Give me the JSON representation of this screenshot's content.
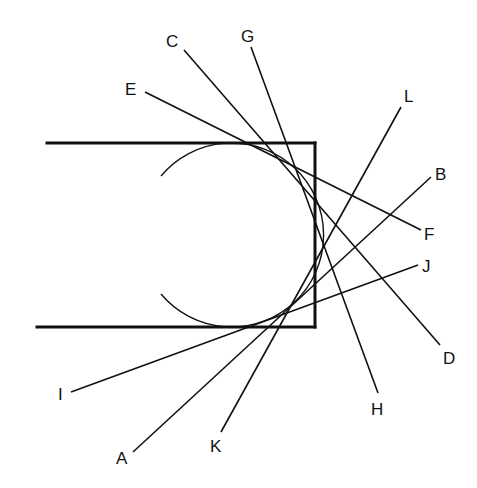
{
  "diagram": {
    "type": "tangent-lines-circle-in-channel",
    "stroke_color": "#111111",
    "background": "#ffffff",
    "channel": {
      "top_edge": {
        "x1": 47,
        "y1": 143,
        "x2": 315,
        "y2": 143
      },
      "right_edge": {
        "x1": 315,
        "y1": 143,
        "x2": 315,
        "y2": 327
      },
      "bottom_edge": {
        "x1": 37,
        "y1": 327,
        "x2": 315,
        "y2": 327
      }
    },
    "circle": {
      "cx": 222,
      "cy": 235,
      "r": 92,
      "arc_path": "M 161 176 A 92 92 0 1 1 161 294"
    },
    "lines": [
      {
        "name": "C-D",
        "from": "C",
        "to": "D",
        "x1": 184,
        "y1": 50,
        "x2": 440,
        "y2": 345
      },
      {
        "name": "G-H",
        "from": "G",
        "to": "H",
        "x1": 251,
        "y1": 47,
        "x2": 378,
        "y2": 393
      },
      {
        "name": "E-F",
        "from": "E",
        "to": "F",
        "x1": 145,
        "y1": 92,
        "x2": 421,
        "y2": 230
      },
      {
        "name": "L-K",
        "from": "L",
        "to": "K",
        "x1": 401,
        "y1": 107,
        "x2": 221,
        "y2": 432
      },
      {
        "name": "B-A",
        "from": "B",
        "to": "A",
        "x1": 431,
        "y1": 177,
        "x2": 133,
        "y2": 452
      },
      {
        "name": "J-I",
        "from": "J",
        "to": "I",
        "x1": 418,
        "y1": 265,
        "x2": 71,
        "y2": 392
      }
    ],
    "labels": [
      {
        "text": "C",
        "x": 166,
        "y": 47
      },
      {
        "text": "G",
        "x": 241,
        "y": 42
      },
      {
        "text": "E",
        "x": 125,
        "y": 95
      },
      {
        "text": "L",
        "x": 404,
        "y": 102
      },
      {
        "text": "B",
        "x": 435,
        "y": 180
      },
      {
        "text": "F",
        "x": 424,
        "y": 240
      },
      {
        "text": "J",
        "x": 422,
        "y": 272
      },
      {
        "text": "D",
        "x": 443,
        "y": 364
      },
      {
        "text": "H",
        "x": 371,
        "y": 415
      },
      {
        "text": "I",
        "x": 58,
        "y": 400
      },
      {
        "text": "A",
        "x": 116,
        "y": 464
      },
      {
        "text": "K",
        "x": 210,
        "y": 452
      }
    ]
  }
}
